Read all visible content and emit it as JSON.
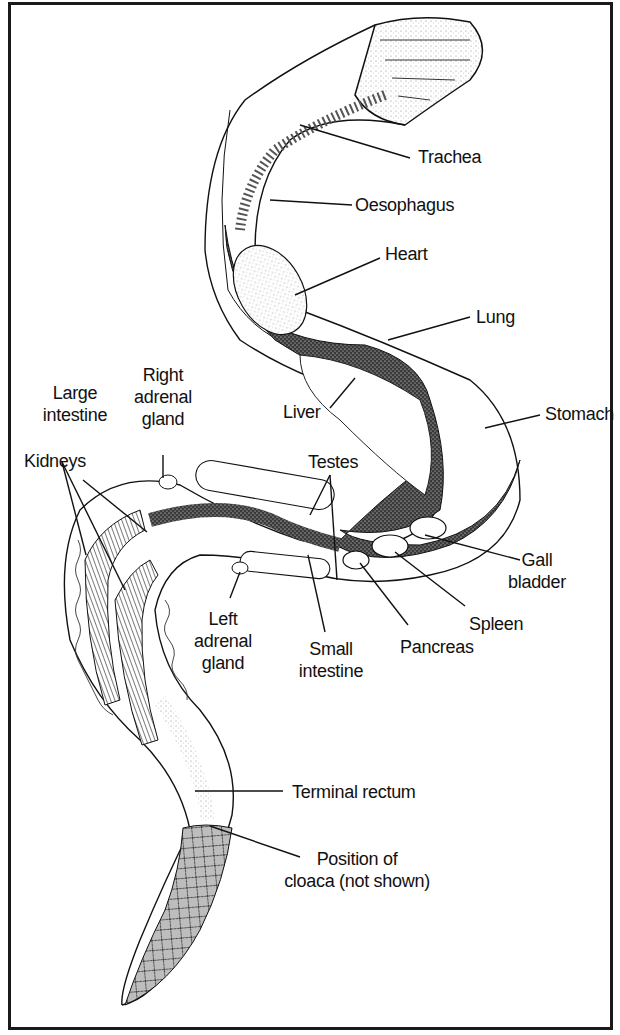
{
  "diagram": {
    "colors": {
      "ink": "#111111",
      "border": "#1a1a1a",
      "background": "#ffffff",
      "stipple": "#2a2a2a"
    },
    "labels": {
      "trachea": "Trachea",
      "oesophagus": "Oesophagus",
      "heart": "Heart",
      "lung": "Lung",
      "liver": "Liver",
      "stomach": "Stomach",
      "right_adrenal": [
        "Right",
        "adrenal",
        "gland"
      ],
      "large_intestine": [
        "Large",
        "intestine"
      ],
      "kidneys": "Kidneys",
      "testes": "Testes",
      "gall_bladder": [
        "Gall",
        "bladder"
      ],
      "spleen": "Spleen",
      "pancreas": "Pancreas",
      "small_intestine": [
        "Small",
        "intestine"
      ],
      "left_adrenal": [
        "Left",
        "adrenal",
        "gland"
      ],
      "terminal_rectum": "Terminal rectum",
      "cloaca": [
        "Position of",
        "cloaca (not shown)"
      ]
    }
  }
}
